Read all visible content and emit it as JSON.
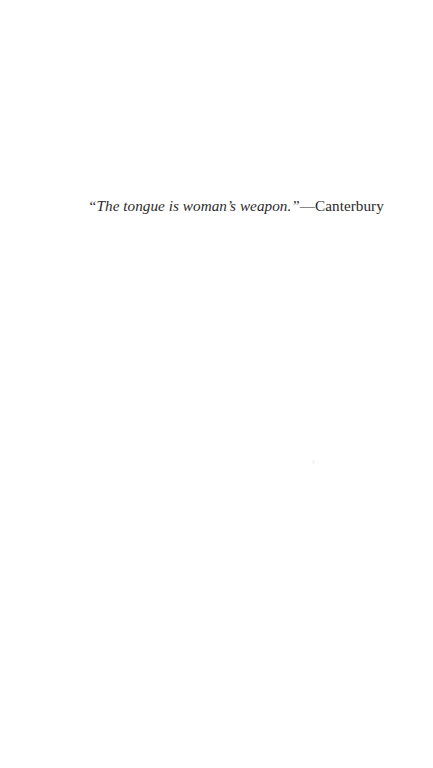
{
  "page": {
    "background_color": "#ffffff",
    "text_color": "#2b2b2b",
    "width": 433,
    "height": 768
  },
  "epigraph": {
    "quote": "“The tongue is woman’s weapon.”",
    "attribution": "—Canterbury",
    "full_line": "“The tongue is woman’s weapon.”—Canterbury"
  },
  "artifacts": {
    "speck_label": ""
  }
}
